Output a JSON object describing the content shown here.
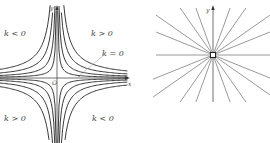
{
  "figure_left": {
    "title": "Hyperbola family xy = k",
    "axis_x_label": "x",
    "axis_y_label": "y",
    "origin_label": "O",
    "region_labels": {
      "top_left": "k < 0",
      "top_right": "k > 0",
      "bottom_left": "k > 0",
      "bottom_right": "k < 0",
      "axis_note": "k = 0"
    },
    "k_values": [
      0.6,
      1.6,
      3.2,
      5.5
    ],
    "stroke_color": "#222222"
  },
  "figure_right": {
    "title": "Lines through the origin",
    "axis_y_label": "y",
    "line_count": 8,
    "stroke_color": "#555555"
  }
}
